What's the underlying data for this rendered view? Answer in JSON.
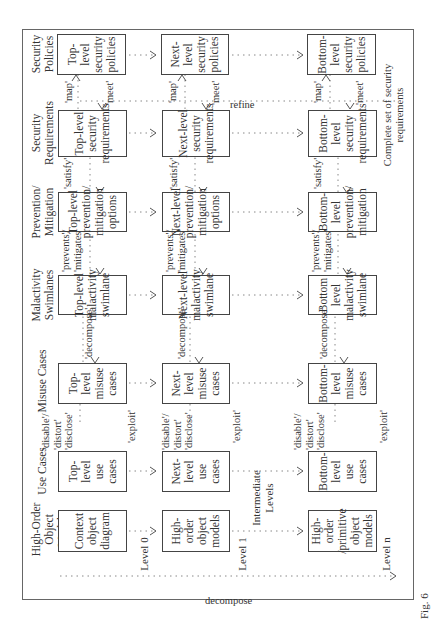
{
  "figure": {
    "caption_fragment": "Fig. 6",
    "columns": [
      {
        "id": "hoom",
        "header": "High-Order Object Models"
      },
      {
        "id": "uc",
        "header": "Use Cases"
      },
      {
        "id": "muc",
        "header": "Misuse Cases"
      },
      {
        "id": "mal",
        "header": "Malactivity Swimlanes"
      },
      {
        "id": "pm",
        "header": "Prevention/ Mitigation"
      },
      {
        "id": "sr",
        "header": "Security Requirements"
      },
      {
        "id": "sp",
        "header": "Security Policies"
      }
    ],
    "levels": [
      {
        "id": "l0",
        "label": "Level 0"
      },
      {
        "id": "l1",
        "label": "Level 1"
      },
      {
        "id": "lint",
        "label": "Intermediate Levels"
      },
      {
        "id": "ln",
        "label": "Level n"
      }
    ],
    "boxes": {
      "l0": {
        "hoom": "Context object diagram",
        "uc": "Top-level use cases",
        "muc": "Top-level misuse cases",
        "mal": "Top-level malactivity swimlane",
        "pm": "Top-level prevention/ mitigation options",
        "sr": "Top-level security requirements",
        "sp": "Top-level security policies"
      },
      "l1": {
        "hoom": "High-order object models",
        "uc": "Next-level use cases",
        "muc": "Next-level misuse cases",
        "mal": "Next-level malactivity swimlane",
        "pm": "Next-level prevention/ mitigation options",
        "sr": "Next-level security requirements",
        "sp": "Next-level security policies"
      },
      "ln": {
        "hoom": "High-order /primitive object models",
        "uc": "Bottom-level use cases",
        "muc": "Bottom-level misuse cases",
        "mal": "Bottom level malactivity swimlane",
        "pm": "Bottom-level prevention/ mitigation",
        "sr": "Bottom-level security requirements",
        "sp": "Bottom-level security policies"
      }
    },
    "relations": {
      "uc_muc_threat": "'disable'/ 'distort' 'disclose'",
      "uc_muc_exploit": "'exploit'",
      "muc_mal": "'decompose'",
      "mal_pm": "'prevents'/ 'mitigates'",
      "pm_sr": "'satisfy'",
      "sr_sp_map": "'map'",
      "sr_sp_meet": "'meet'"
    },
    "axis_labels": {
      "decompose": "decompose",
      "refine": "refine",
      "complete_set": "Complete set of security requirements"
    }
  }
}
